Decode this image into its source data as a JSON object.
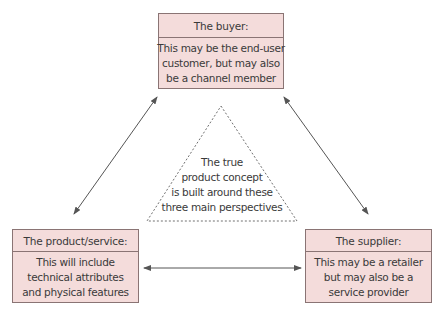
{
  "diagram": {
    "title": "",
    "nodes": {
      "buyer": {
        "header": "The buyer:",
        "body_lines": [
          "This may be the end-user",
          "customer, but may also",
          "be a channel member"
        ]
      },
      "product": {
        "header": "The product/service:",
        "body_lines": [
          "This will include",
          "technical attributes",
          "and physical features"
        ]
      },
      "supplier": {
        "header": "The supplier:",
        "body_lines": [
          "This may be a retailer",
          "but may also be a",
          "service provider"
        ]
      }
    },
    "center": {
      "shape": "dashed-triangle",
      "lines": [
        "The true",
        "product concept",
        "is built around these",
        "three main perspectives"
      ]
    },
    "edges": [
      {
        "from": "product",
        "to": "buyer",
        "type": "double-arrow"
      },
      {
        "from": "buyer",
        "to": "supplier",
        "type": "double-arrow"
      },
      {
        "from": "product",
        "to": "supplier",
        "type": "double-arrow"
      }
    ],
    "colors": {
      "box_fill": "#f4dcdb",
      "box_border": "#8a7474",
      "line": "#555555",
      "text": "#3a3a3a"
    }
  }
}
